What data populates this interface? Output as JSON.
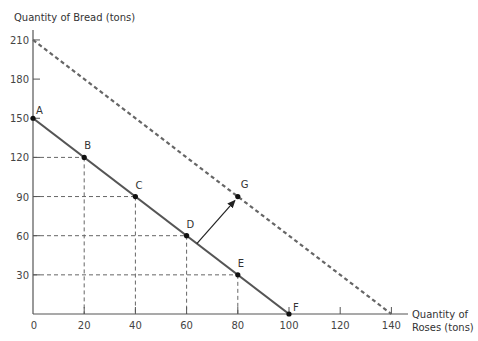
{
  "chart_data": {
    "type": "line",
    "title": "",
    "ylabel": "Quantity of Bread (tons)",
    "xlabel_line1": "Quantity of",
    "xlabel_line2": "Roses (tons)",
    "xlim": [
      0,
      140
    ],
    "ylim": [
      0,
      210
    ],
    "x_ticks": [
      0,
      20,
      40,
      60,
      80,
      100,
      120,
      140
    ],
    "y_ticks": [
      30,
      60,
      90,
      120,
      150,
      180,
      210
    ],
    "grid": false,
    "series": [
      {
        "name": "Original PPF",
        "style": "solid",
        "x": [
          0,
          100
        ],
        "y": [
          150,
          0
        ]
      },
      {
        "name": "Shifted PPF",
        "style": "dashed",
        "x": [
          0,
          140
        ],
        "y": [
          210,
          0
        ]
      }
    ],
    "points": [
      {
        "label": "A",
        "x": 0,
        "y": 150
      },
      {
        "label": "B",
        "x": 20,
        "y": 120
      },
      {
        "label": "C",
        "x": 40,
        "y": 90
      },
      {
        "label": "D",
        "x": 60,
        "y": 60
      },
      {
        "label": "E",
        "x": 80,
        "y": 30
      },
      {
        "label": "F",
        "x": 100,
        "y": 0
      },
      {
        "label": "G",
        "x": 80,
        "y": 90
      }
    ],
    "annotations": [
      {
        "type": "arrow",
        "from": [
          64,
          54
        ],
        "to": [
          80,
          90
        ],
        "text": ""
      }
    ]
  }
}
